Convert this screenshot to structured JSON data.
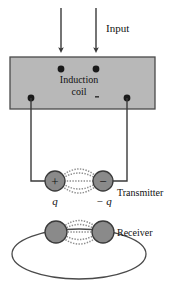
{
  "figure": {
    "background_color": "#ffffff",
    "width": 180,
    "height": 287
  },
  "colors": {
    "stroke": "#3a3a3a",
    "text": "#111111",
    "box_fill": "#b8b8b8",
    "box_stroke": "#4a4a4a",
    "sphere_fill": "#8a8a8a",
    "sphere_stroke": "#4a4a4a",
    "terminal_fill": "#1a1a1a",
    "field_line": "#8d8d8d",
    "loop_stroke": "#4a4a4a"
  },
  "labels": {
    "input": "Input",
    "induction_line1": "Induction",
    "induction_line2": "coil",
    "transmitter": "Transmitter",
    "receiver": "Receiver",
    "charge_positive": "q",
    "charge_negative": "− q",
    "sphere_positive_sign": "+",
    "sphere_negative_sign": "−"
  },
  "icons": {
    "arrow_left": "down-arrow-icon",
    "arrow_right": "down-arrow-icon"
  },
  "geometry": {
    "input_arrows": [
      {
        "x": 61,
        "y_start": 8,
        "y_end": 52
      },
      {
        "x": 96,
        "y_start": 8,
        "y_end": 52
      }
    ],
    "coil_box": {
      "x": 10,
      "y": 57,
      "width": 145,
      "height": 52
    },
    "terminals": [
      {
        "name": "top-left",
        "cx": 61,
        "cy": 69
      },
      {
        "name": "top-right",
        "cx": 96,
        "cy": 69
      },
      {
        "name": "bottom-left",
        "cx": 31,
        "cy": 98
      },
      {
        "name": "bottom-right",
        "cx": 127,
        "cy": 98
      }
    ],
    "transmitter": {
      "sphere_positive": {
        "cx": 55,
        "cy": 181,
        "r": 10
      },
      "sphere_negative": {
        "cx": 103,
        "cy": 181,
        "r": 10
      },
      "wire_left": "M31,98 L31,181 L45,181",
      "wire_right": "M127,98 L127,181 L113,181"
    },
    "receiver": {
      "sphere_left": {
        "cx": 56,
        "cy": 232,
        "r": 11
      },
      "sphere_right": {
        "cx": 103,
        "cy": 232,
        "r": 11
      },
      "loop": {
        "cx": 79,
        "cy": 254,
        "rx": 67,
        "ry": 25
      }
    }
  }
}
